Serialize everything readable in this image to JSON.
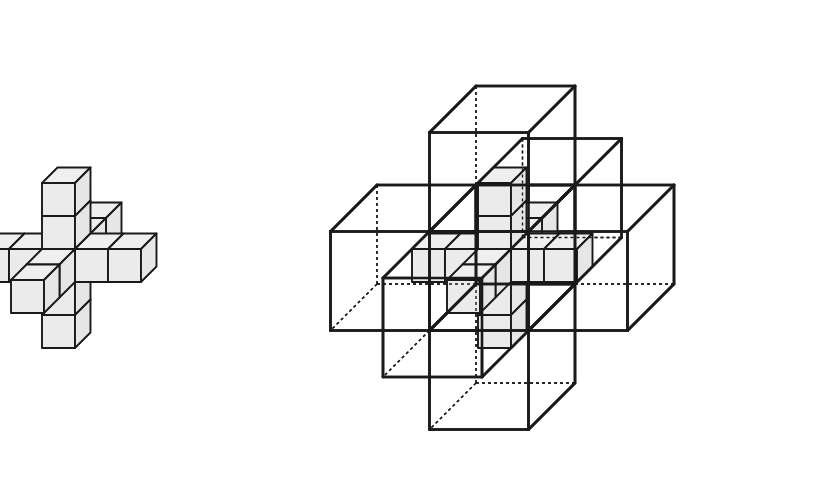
{
  "canvas": {
    "width": 821,
    "height": 482,
    "background": "#ffffff"
  },
  "style": {
    "cube_fill": "#ebebeb",
    "cube_top_fill": "#efefef",
    "cube_side_fill": "#e6e6e6",
    "stroke": "#1a1a1a",
    "stroke_width_cube": 1.9,
    "stroke_width_box": 2.6,
    "stroke_width_hidden": 1.4,
    "hidden_dash": "3,3",
    "box_fill": "none"
  },
  "projection": {
    "type": "isometric-oblique",
    "unit_px": 33,
    "x_axis_px": [
      33,
      0
    ],
    "y_axis_px": [
      0,
      -33
    ],
    "z_axis_px": [
      15.5,
      -15.5
    ],
    "note": "screen = origin + x*ax + y*ay + z*az; y is up, z recedes up-right"
  },
  "figures": [
    {
      "id": "solid-cross",
      "name": "solid-polycube-cross",
      "origin_px": [
        42,
        282
      ],
      "description": "Thirteen unit cubes forming a 3D plus sign: a center cube with two cubes extending along each of the six axis directions.",
      "cube_count": 13,
      "cubes": [
        [
          0,
          0,
          0
        ],
        [
          -1,
          0,
          0
        ],
        [
          -2,
          0,
          0
        ],
        [
          1,
          0,
          0
        ],
        [
          2,
          0,
          0
        ],
        [
          0,
          1,
          0
        ],
        [
          0,
          2,
          0
        ],
        [
          0,
          -1,
          0
        ],
        [
          0,
          -2,
          0
        ],
        [
          0,
          0,
          1
        ],
        [
          0,
          0,
          2
        ],
        [
          0,
          0,
          -1
        ],
        [
          0,
          0,
          -2
        ]
      ],
      "shells": []
    },
    {
      "id": "shelled-cross",
      "name": "polycube-cross-with-transparent-boxes",
      "origin_px": [
        478,
        282
      ],
      "description": "The same thirteen-cube cross drawn inside seven large transparent wireframe boxes; hidden edges of the boxes are dashed.",
      "cube_count": 13,
      "cubes": [
        [
          0,
          0,
          0
        ],
        [
          -1,
          0,
          0
        ],
        [
          -2,
          0,
          0
        ],
        [
          1,
          0,
          0
        ],
        [
          2,
          0,
          0
        ],
        [
          0,
          1,
          0
        ],
        [
          0,
          2,
          0
        ],
        [
          0,
          -1,
          0
        ],
        [
          0,
          -2,
          0
        ],
        [
          0,
          0,
          1
        ],
        [
          0,
          0,
          2
        ],
        [
          0,
          0,
          -1
        ],
        [
          0,
          0,
          -2
        ]
      ],
      "shell_size": 3,
      "shells": [
        {
          "name": "shell-center",
          "min": [
            -1,
            -1,
            -1
          ]
        },
        {
          "name": "shell-left",
          "min": [
            -4,
            -1,
            -1
          ]
        },
        {
          "name": "shell-right",
          "min": [
            2,
            -1,
            -1
          ]
        },
        {
          "name": "shell-top",
          "min": [
            -1,
            2,
            -1
          ]
        },
        {
          "name": "shell-bottom",
          "min": [
            -1,
            -4,
            -1
          ]
        },
        {
          "name": "shell-back",
          "min": [
            -1,
            -1,
            2
          ]
        },
        {
          "name": "shell-front",
          "min": [
            -1,
            -1,
            -4
          ]
        }
      ]
    }
  ],
  "labels": {
    "left_figure_caption": "",
    "right_figure_caption": ""
  }
}
